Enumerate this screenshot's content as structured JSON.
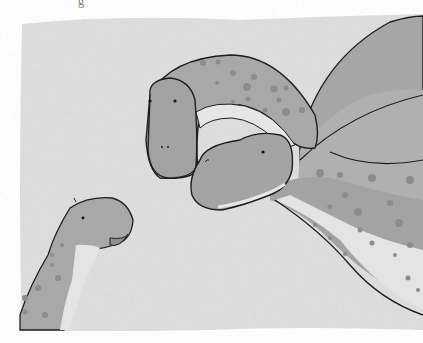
{
  "image": {
    "description": "Grayscale watercolor illustration of three spotted long-necked dinosaurs",
    "caption_fragment": "g",
    "colors": {
      "background_wash": "#dcdcdc",
      "page": "#ffffff",
      "body": "#a9a9a9",
      "belly": "#e6e6e6",
      "spots": "#8a8a8a",
      "outline": "#1e1e1e"
    },
    "subjects": [
      {
        "name": "adult-dinosaur-front",
        "position": "center-top"
      },
      {
        "name": "adult-dinosaur-back",
        "position": "right"
      },
      {
        "name": "baby-dinosaur",
        "position": "bottom-left"
      }
    ]
  }
}
